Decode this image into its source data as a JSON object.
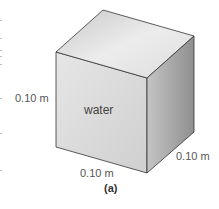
{
  "figure": {
    "caption": "(a)",
    "object": "cube",
    "content_label": "water",
    "dimensions": {
      "height": "0.10 m",
      "width": "0.10 m",
      "depth": "0.10 m"
    },
    "colors": {
      "front_face": "#dcdcdc",
      "top_face": "#e8e8e8",
      "side_face": "#a9a9a9",
      "edge": "#333333",
      "label_text": "#555555"
    }
  }
}
